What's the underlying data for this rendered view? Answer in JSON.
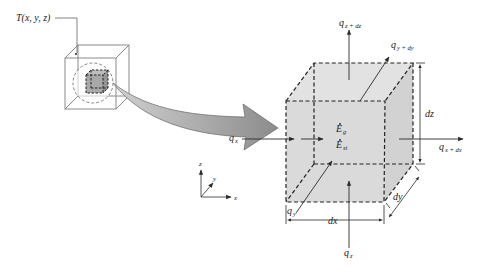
{
  "colors": {
    "background": "#ffffff",
    "cube_fill": "#d9d9d9",
    "inner_cube_fill": "#a9a9a9",
    "line": "#2a2a2a",
    "wire": "#8a8a8a",
    "arrow_fill": "#a8a8a8"
  },
  "labels": {
    "temperature_point": "T(x, y, z)",
    "qx": {
      "base": "q",
      "sub": "x"
    },
    "qx_dx": {
      "base": "q",
      "sub": "x + dx"
    },
    "qy": {
      "base": "q",
      "sub": "y"
    },
    "qy_dy": {
      "base": "q",
      "sub": "y + dy"
    },
    "qz": {
      "base": "q",
      "sub": "z"
    },
    "qz_dz": {
      "base": "q",
      "sub": "z + dz"
    },
    "eg": {
      "base": "E",
      "sub": "g"
    },
    "est": {
      "base": "E",
      "sub": "st"
    },
    "dx": "dx",
    "dy": "dy",
    "dz": "dz",
    "axis_x": "x",
    "axis_y": "y",
    "axis_z": "z"
  }
}
